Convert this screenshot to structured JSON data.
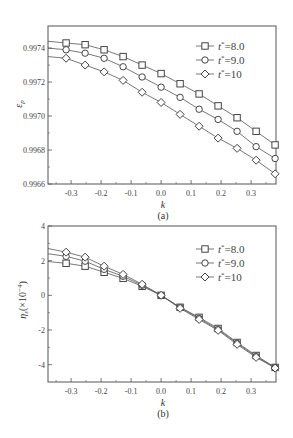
{
  "chart_data": [
    {
      "type": "line",
      "panel": "(a)",
      "title": "",
      "xlabel": "k",
      "ylabel": "ε_p",
      "xlim": [
        -0.377,
        0.383
      ],
      "ylim": [
        0.9966,
        0.99753
      ],
      "xticks": [
        -0.3,
        -0.2,
        -0.1,
        0.0,
        0.1,
        0.2,
        0.3
      ],
      "xtick_labels": [
        "-0.3",
        "-0.2",
        "-0.1",
        "0.0",
        "0.1",
        "0.2",
        "0.3"
      ],
      "yticks": [
        0.9966,
        0.9968,
        0.997,
        0.9972,
        0.9974
      ],
      "ytick_labels": [
        "0.9966",
        "0.9968",
        "0.9970",
        "0.9972",
        "0.9974"
      ],
      "grid": false,
      "legend_position": "upper right",
      "x": [
        -0.3167,
        -0.2533,
        -0.19,
        -0.1267,
        -0.0633,
        0.0,
        0.0633,
        0.1267,
        0.19,
        0.2533,
        0.3167,
        0.38
      ],
      "series": [
        {
          "name": "t*=8.0",
          "marker": "square",
          "line_start": 0.99744,
          "values": [
            0.99743,
            0.99742,
            0.99739,
            0.99735,
            0.9973,
            0.99725,
            0.99719,
            0.99713,
            0.99706,
            0.99699,
            0.99691,
            0.99683
          ]
        },
        {
          "name": "t*=9.0",
          "marker": "circle",
          "line_start": 0.9974,
          "values": [
            0.99739,
            0.99737,
            0.99734,
            0.99729,
            0.99723,
            0.99717,
            0.99711,
            0.99704,
            0.99698,
            0.99691,
            0.99682,
            0.99675
          ]
        },
        {
          "name": "t*=10",
          "marker": "diamond",
          "line_start": 0.99735,
          "values": [
            0.99734,
            0.9973,
            0.99726,
            0.99721,
            0.99714,
            0.99708,
            0.99701,
            0.99694,
            0.99687,
            0.99681,
            0.99674,
            0.99666
          ]
        }
      ]
    },
    {
      "type": "line",
      "panel": "(b)",
      "title": "",
      "xlabel": "k",
      "ylabel": "η_ε(×10⁻⁴)",
      "xlim": [
        -0.377,
        0.383
      ],
      "ylim": [
        -5.0,
        4.0
      ],
      "xticks": [
        -0.3,
        -0.2,
        -0.1,
        0.0,
        0.1,
        0.2,
        0.3
      ],
      "xtick_labels": [
        "-0.3",
        "-0.2",
        "-0.1",
        "0.0",
        "0.1",
        "0.2",
        "0.3"
      ],
      "yticks": [
        -4,
        -2,
        0,
        2,
        4
      ],
      "ytick_labels": [
        "-4",
        "-2",
        "0",
        "2",
        "4"
      ],
      "grid": false,
      "legend_position": "upper right",
      "x": [
        -0.3167,
        -0.2533,
        -0.19,
        -0.1267,
        -0.0633,
        0.0,
        0.0633,
        0.1267,
        0.19,
        0.2533,
        0.3167,
        0.38
      ],
      "series": [
        {
          "name": "t*=8.0",
          "marker": "square",
          "line_start": 1.95,
          "values": [
            1.85,
            1.68,
            1.33,
            0.98,
            0.52,
            0.0,
            -0.69,
            -1.27,
            -1.91,
            -2.72,
            -3.47,
            -4.16
          ]
        },
        {
          "name": "t*=9.0",
          "marker": "circle",
          "line_start": 2.4,
          "values": [
            2.25,
            1.97,
            1.5,
            1.1,
            0.58,
            0.0,
            -0.7,
            -1.33,
            -1.97,
            -2.77,
            -3.53,
            -4.16
          ]
        },
        {
          "name": "t*=10",
          "marker": "diamond",
          "line_start": 2.7,
          "values": [
            2.49,
            2.2,
            1.68,
            1.21,
            0.64,
            0.0,
            -0.75,
            -1.39,
            -2.02,
            -2.83,
            -3.58,
            -4.2
          ]
        }
      ]
    }
  ],
  "panels": {
    "a": {
      "caption": "(a)",
      "xlabel": "k",
      "ylabel_main": "ε",
      "ylabel_sub": "p"
    },
    "b": {
      "caption": "(b)",
      "xlabel": "k",
      "ylabel_main": "η",
      "ylabel_sub": "ε",
      "ylabel_suffix": "(×10",
      "ylabel_exp": "−4",
      "ylabel_close": ")"
    }
  },
  "legend": [
    {
      "prefix": "t",
      "sup": "*",
      "suffix": "=8.0",
      "marker": "square"
    },
    {
      "prefix": "t",
      "sup": "*",
      "suffix": "=9.0",
      "marker": "circle"
    },
    {
      "prefix": "t",
      "sup": "*",
      "suffix": "=10",
      "marker": "diamond"
    }
  ],
  "colors": {
    "line": "#555555",
    "marker": "#444444",
    "axis": "#555555",
    "text": "#444444"
  }
}
